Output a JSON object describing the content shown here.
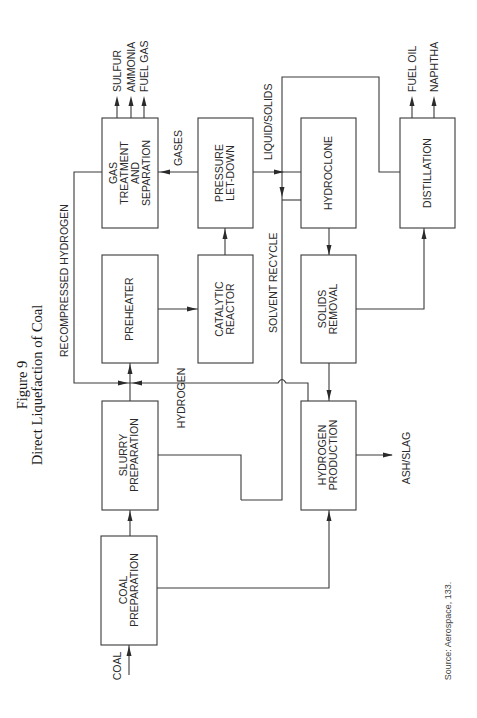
{
  "figure": {
    "number": "Figure 9",
    "title": "Direct Liquefaction of Coal",
    "source": "Source: Aerospace, 133."
  },
  "boxes": {
    "gas_treatment": [
      "GAS",
      "TREATMENT",
      "AND",
      "SEPARATION"
    ],
    "pressure_letdown": [
      "PRESSURE",
      "LET-DOWN"
    ],
    "hydroclone": [
      "HYDROCLONE"
    ],
    "distillation": [
      "DISTILLATION"
    ],
    "preheater": [
      "PREHEATER"
    ],
    "catalytic_reactor": [
      "CATALYTIC",
      "REACTOR"
    ],
    "solids_removal": [
      "SOLIDS",
      "REMOVAL"
    ],
    "slurry_preparation": [
      "SLURRY",
      "PREPARATION"
    ],
    "hydrogen_production": [
      "HYDROGEN",
      "PRODUCTION"
    ],
    "coal_preparation": [
      "COAL",
      "PREPARATION"
    ]
  },
  "flows": {
    "sulfur": "SULFUR",
    "ammonia": "AMMONIA",
    "fuel_gas": "FUEL GAS",
    "gases": "GASES",
    "liquid_solids": "LIQUID/SOLIDS",
    "fuel_oil": "FUEL OIL",
    "naphtha": "NAPHTHA",
    "recompressed_hydrogen": "RECOMPRESSED HYDROGEN",
    "hydrogen": "HYDROGEN",
    "solvent_recycle": "SOLVENT RECYCLE",
    "ash_slag": "ASH/SLAG",
    "coal": "COAL"
  }
}
